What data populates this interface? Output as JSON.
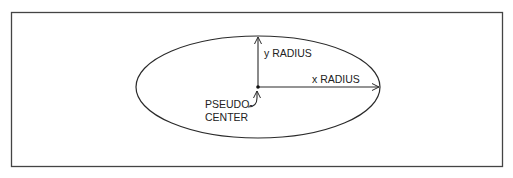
{
  "diagram": {
    "labels": {
      "y_radius": "y RADIUS",
      "x_radius": "x RADIUS",
      "pseudo_center_line1": "PSEUDO-",
      "pseudo_center_line2": "CENTER"
    },
    "colors": {
      "stroke": "#2a2a2a",
      "frame": "#444444",
      "background": "#ffffff"
    }
  }
}
